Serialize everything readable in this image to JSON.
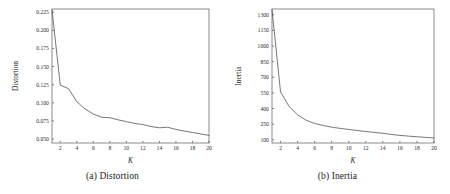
{
  "figure": {
    "panel_a_caption": "(a) Distortion",
    "panel_b_caption": "(b) Inertia",
    "line_color": "#4a4a4a",
    "axis_color": "#3c3c3c",
    "background": "#ffffff"
  },
  "chart_data": [
    {
      "type": "line",
      "title": "(a) Distortion",
      "xlabel": "K",
      "ylabel": "Distortion",
      "xlim": [
        1,
        20
      ],
      "ylim": [
        0.0445,
        0.2295
      ],
      "grid": false,
      "legend": null,
      "xticks": [
        2,
        4,
        6,
        8,
        10,
        12,
        14,
        16,
        18,
        20
      ],
      "xtick_labels": [
        "2",
        "4",
        "6",
        "8",
        "10",
        "12",
        "14",
        "16",
        "18",
        "20"
      ],
      "yticks": [
        0.05,
        0.075,
        0.1,
        0.125,
        0.15,
        0.175,
        0.2,
        0.225
      ],
      "ytick_labels": [
        "0.050",
        "0.075",
        "0.100",
        "0.125",
        "0.150",
        "0.175",
        "0.200",
        "0.225"
      ],
      "x": [
        1,
        2,
        3,
        4,
        5,
        6,
        7,
        8,
        9,
        10,
        11,
        12,
        13,
        14,
        15,
        16,
        17,
        18,
        19,
        20
      ],
      "values": [
        0.2285,
        0.1245,
        0.1195,
        0.1015,
        0.0915,
        0.0845,
        0.08,
        0.0795,
        0.0765,
        0.074,
        0.0715,
        0.07,
        0.0672,
        0.0655,
        0.0662,
        0.0632,
        0.061,
        0.059,
        0.057,
        0.055
      ]
    },
    {
      "type": "line",
      "title": "(b) Inertia",
      "xlabel": "K",
      "ylabel": "Inertia",
      "xlim": [
        1,
        20
      ],
      "ylim": [
        70,
        1355
      ],
      "grid": false,
      "legend": null,
      "xticks": [
        2,
        4,
        6,
        8,
        10,
        12,
        14,
        16,
        18,
        20
      ],
      "xtick_labels": [
        "2",
        "4",
        "6",
        "8",
        "10",
        "12",
        "14",
        "16",
        "18",
        "20"
      ],
      "yticks": [
        100,
        250,
        400,
        550,
        700,
        850,
        1000,
        1150,
        1300
      ],
      "ytick_labels": [
        "100",
        "250",
        "400",
        "550",
        "700",
        "850",
        "1000",
        "1150",
        "1300"
      ],
      "x": [
        1,
        2,
        3,
        4,
        5,
        6,
        7,
        8,
        9,
        10,
        11,
        12,
        13,
        14,
        15,
        16,
        17,
        18,
        19,
        20
      ],
      "values": [
        1350,
        560,
        420,
        340,
        288,
        258,
        238,
        222,
        210,
        200,
        190,
        180,
        172,
        163,
        152,
        143,
        136,
        130,
        124,
        118
      ]
    }
  ]
}
